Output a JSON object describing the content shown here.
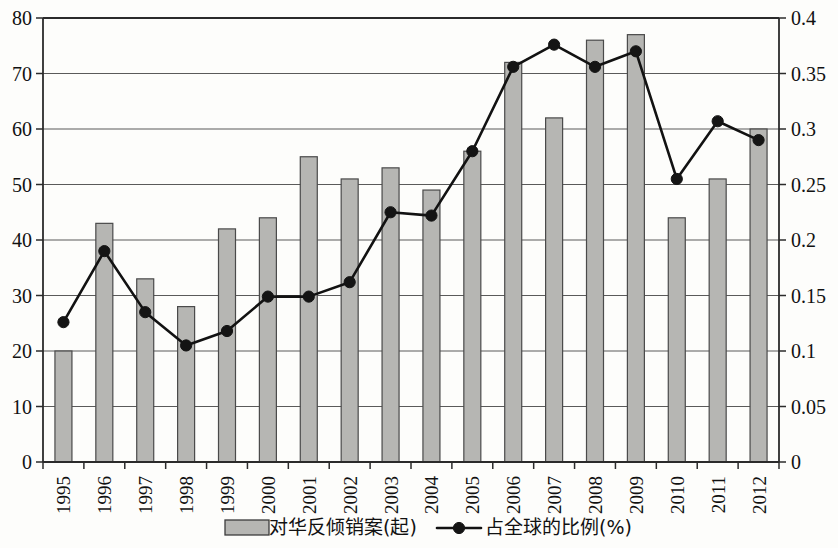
{
  "chart_data": {
    "type": "bar",
    "title": "",
    "subtitle": "",
    "xlabel": "",
    "ylabel": "",
    "grid": true,
    "legend_position": "bottom",
    "categories": [
      "1995",
      "1996",
      "1997",
      "1998",
      "1999",
      "2000",
      "2001",
      "2002",
      "2003",
      "2004",
      "2005",
      "2006",
      "2007",
      "2008",
      "2009",
      "2010",
      "2011",
      "2012"
    ],
    "axes": {
      "left": {
        "label": "",
        "min": 0,
        "max": 80,
        "step": 10,
        "ticks": [
          "0",
          "10",
          "20",
          "30",
          "40",
          "50",
          "60",
          "70",
          "80"
        ]
      },
      "right": {
        "label": "",
        "min": 0,
        "max": 0.4,
        "step": 0.05,
        "ticks": [
          "0",
          "0.05",
          "0.1",
          "0.15",
          "0.2",
          "0.25",
          "0.3",
          "0.35",
          "0.4"
        ]
      }
    },
    "series": [
      {
        "name": "对华反倾销案(起)",
        "type": "bar",
        "axis": "left",
        "color": "#b6b6b3",
        "values": [
          20,
          43,
          33,
          28,
          42,
          44,
          55,
          51,
          53,
          49,
          56,
          72,
          62,
          76,
          77,
          44,
          51,
          60
        ]
      },
      {
        "name": "占全球的比例(%)",
        "type": "line",
        "axis": "right",
        "color": "#141414",
        "values": [
          0.126,
          0.19,
          0.135,
          0.105,
          0.118,
          0.149,
          0.149,
          0.162,
          0.225,
          0.222,
          0.28,
          0.356,
          0.376,
          0.356,
          0.37,
          0.255,
          0.307,
          0.29
        ]
      }
    ]
  },
  "legend": {
    "items": [
      {
        "label": "对华反倾销案(起)",
        "marker": "bar-swatch"
      },
      {
        "label": "占全球的比例(%)",
        "marker": "line-dot"
      }
    ]
  }
}
